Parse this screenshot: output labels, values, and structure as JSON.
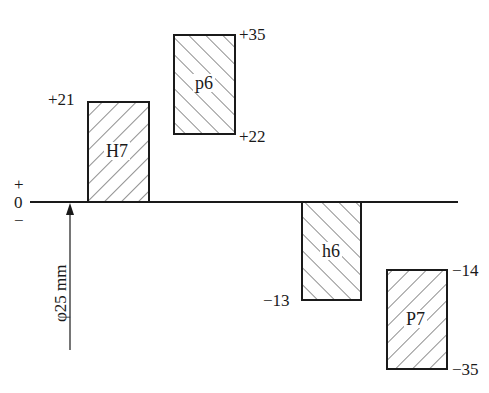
{
  "diagram": {
    "basic_size_label": "φ25 mm",
    "axis": {
      "plus": "+",
      "zero": "0",
      "minus": "−"
    },
    "zones": [
      {
        "name": "H7",
        "upper": "+21",
        "lower": "0",
        "kind": "hole"
      },
      {
        "name": "p6",
        "upper": "+35",
        "lower": "+22",
        "kind": "shaft"
      },
      {
        "name": "h6",
        "upper": "0",
        "lower": "−13",
        "kind": "shaft"
      },
      {
        "name": "P7",
        "upper": "−14",
        "lower": "−35",
        "kind": "hole"
      }
    ],
    "colors": {
      "line": "#1a1a1a",
      "background": "#ffffff"
    }
  }
}
